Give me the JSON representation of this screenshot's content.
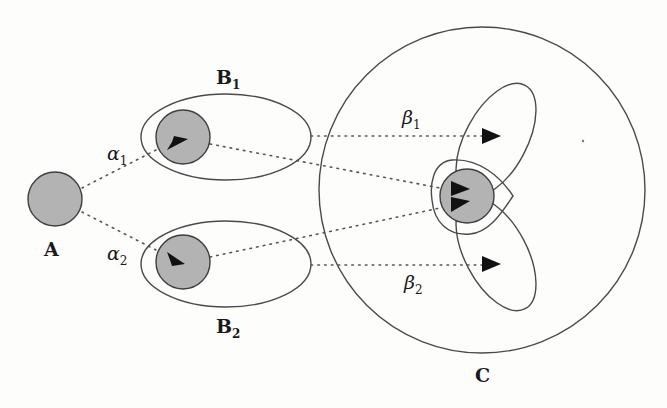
{
  "diagram": {
    "fill_color": "#b3b3b3",
    "nodes": {
      "A": {
        "label": "A"
      },
      "B1": {
        "label": "B",
        "subscript": "1"
      },
      "B2": {
        "label": "B",
        "subscript": "2"
      },
      "C": {
        "label": "C"
      }
    },
    "edges": {
      "alpha1": {
        "label": "α",
        "subscript": "1",
        "from": "A",
        "to": "B1"
      },
      "alpha2": {
        "label": "α",
        "subscript": "2",
        "from": "A",
        "to": "B2"
      },
      "beta1": {
        "label": "β",
        "subscript": "1",
        "from": "B1",
        "to": "C"
      },
      "beta2": {
        "label": "β",
        "subscript": "2",
        "from": "B2",
        "to": "C"
      }
    }
  }
}
